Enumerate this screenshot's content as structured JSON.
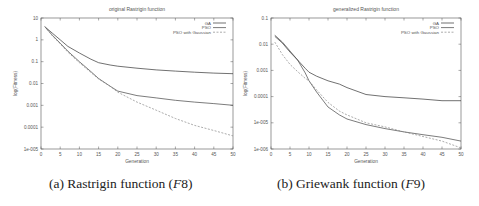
{
  "chart_data": [
    {
      "type": "line",
      "title": "original Rastrigin function",
      "xlabel": "Generation",
      "ylabel": "log(Fitness)",
      "yscale": "log",
      "xlim": [
        0,
        50
      ],
      "ylim": [
        1e-05,
        10
      ],
      "xticks": [
        "0",
        "5",
        "10",
        "15",
        "20",
        "25",
        "30",
        "35",
        "40",
        "45",
        "50"
      ],
      "yticks": [
        "10",
        "1",
        "0.1",
        "0.01",
        "0.001",
        "0.0001",
        "1e-005"
      ],
      "ytick_values": [
        10,
        1,
        0.1,
        0.01,
        0.001,
        0.0001,
        1e-05
      ],
      "legend_position": "top-right",
      "grid": false,
      "caption": "(a) Rastrigin function (F8)",
      "x": [
        1,
        3,
        5,
        7,
        10,
        13,
        15,
        18,
        20,
        25,
        30,
        35,
        40,
        45,
        50
      ],
      "series": [
        {
          "name": "GA",
          "values": [
            4.0,
            2.0,
            1.0,
            0.5,
            0.25,
            0.13,
            0.09,
            0.07,
            0.062,
            0.05,
            0.042,
            0.037,
            0.033,
            0.03,
            0.028
          ]
        },
        {
          "name": "PSO",
          "values": [
            4.0,
            1.6,
            0.7,
            0.3,
            0.1,
            0.035,
            0.017,
            0.0075,
            0.0045,
            0.0028,
            0.0022,
            0.0017,
            0.0014,
            0.0012,
            0.001
          ]
        },
        {
          "name": "PSO with Gaussian",
          "values": [
            4.0,
            1.5,
            0.65,
            0.27,
            0.09,
            0.032,
            0.016,
            0.0075,
            0.004,
            0.0014,
            0.0006,
            0.00025,
            0.00012,
            7e-05,
            4e-05
          ]
        }
      ]
    },
    {
      "type": "line",
      "title": "generalized Rastrigin function",
      "xlabel": "Generation",
      "ylabel": "log(Fitness)",
      "yscale": "log",
      "xlim": [
        0,
        50
      ],
      "ylim": [
        1e-06,
        0.1
      ],
      "xticks": [
        "0",
        "5",
        "10",
        "15",
        "20",
        "25",
        "30",
        "35",
        "40",
        "45",
        "50"
      ],
      "yticks": [
        "0.1",
        "0.01",
        "0.001",
        "0.0001",
        "1e-005",
        "1e-006"
      ],
      "ytick_values": [
        0.1,
        0.01,
        0.001,
        0.0001,
        1e-05,
        1e-06
      ],
      "legend_position": "top-right",
      "grid": false,
      "caption": "(b) Griewank function (F9)",
      "x": [
        1,
        3,
        5,
        7,
        9,
        10,
        12,
        15,
        18,
        20,
        25,
        30,
        35,
        40,
        45,
        50
      ],
      "series": [
        {
          "name": "GA",
          "values": [
            0.02,
            0.011,
            0.005,
            0.0025,
            0.0012,
            0.00085,
            0.0006,
            0.0004,
            0.0003,
            0.00022,
            0.00012,
            0.0001,
            9e-05,
            8e-05,
            7e-05,
            7e-05
          ]
        },
        {
          "name": "PSO",
          "values": [
            0.022,
            0.012,
            0.0055,
            0.0025,
            0.0008,
            0.0004,
            0.00015,
            4e-05,
            2e-05,
            1.4e-05,
            8.5e-06,
            6e-06,
            4.5e-06,
            3.5e-06,
            2.8e-06,
            2e-06
          ]
        },
        {
          "name": "PSO with Gaussian",
          "values": [
            0.012,
            0.004,
            0.0017,
            0.0009,
            0.0005,
            0.0004,
            0.00018,
            6e-05,
            2.8e-05,
            2e-05,
            1e-05,
            7e-06,
            4.5e-06,
            3e-06,
            2e-06,
            1.1e-06
          ]
        }
      ]
    }
  ],
  "captions": {
    "a_prefix": "(a) Rastrigin function (",
    "a_var": "F",
    "a_num": "8",
    "a_suffix": ")",
    "b_prefix": "(b) Griewank function (",
    "b_var": "F",
    "b_num": "9",
    "b_suffix": ")"
  },
  "style": {
    "axis_color": "#555555",
    "text_color": "#555555",
    "series_colors": [
      "#333333",
      "#444444",
      "#888888"
    ]
  }
}
